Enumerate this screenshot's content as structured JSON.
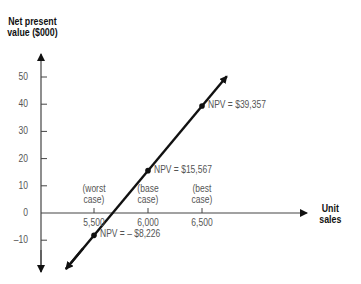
{
  "chart_data": {
    "type": "line",
    "title": "",
    "xlabel": "Unit sales",
    "ylabel": "Net present value ($000)",
    "ylabel_lines": [
      "Net present",
      "value ($000)"
    ],
    "xlabel_lines": [
      "Unit",
      "sales"
    ],
    "y_ticks": [
      50,
      40,
      30,
      20,
      10,
      0,
      -10
    ],
    "y_tick_labels": [
      "50",
      "40",
      "30",
      "20",
      "10",
      "0",
      "–10"
    ],
    "x_ticks": [
      5500,
      6000,
      6500
    ],
    "x_tick_labels": [
      "5,500",
      "6,000",
      "6,500"
    ],
    "ylim": [
      -18,
      60
    ],
    "grid": false,
    "series": [
      {
        "name": "NPV",
        "x": [
          5500,
          6000,
          6500
        ],
        "y": [
          -8.226,
          15.567,
          39.357
        ],
        "color": "#111111"
      }
    ],
    "annotations": [
      {
        "case_lines": [
          "(worst",
          "case)"
        ],
        "npv_label": "NPV = – $8,226",
        "x": 5500,
        "y": -8.226
      },
      {
        "case_lines": [
          "(base",
          "case)"
        ],
        "npv_label": "NPV = $15,567",
        "x": 6000,
        "y": 15.567
      },
      {
        "case_lines": [
          "(best",
          "case)"
        ],
        "npv_label": "NPV = $39,357",
        "x": 6500,
        "y": 39.357
      }
    ]
  }
}
